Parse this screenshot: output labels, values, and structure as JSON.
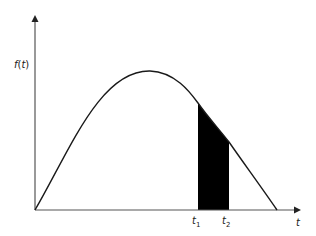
{
  "diagram": {
    "type": "probability-density-curve",
    "y_axis_label": "f(t)",
    "x_axis_label": "t",
    "markers": [
      {
        "label": "t",
        "subscript": "1"
      },
      {
        "label": "t",
        "subscript": "2"
      }
    ],
    "shaded_region": "area under f(t) between t1 and t2",
    "colors": {
      "axis": "#555555",
      "curve": "#1a1a1a",
      "shade": "#000000",
      "background": "#ffffff"
    }
  }
}
